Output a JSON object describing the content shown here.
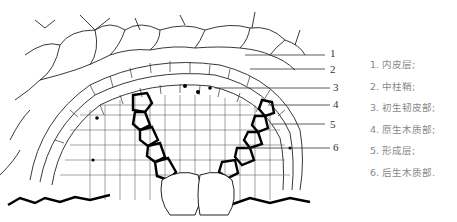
{
  "figure": {
    "type": "root cross-section diagram",
    "callouts": [
      {
        "number": "1",
        "y": 47
      },
      {
        "number": "2",
        "y": 67
      },
      {
        "number": "3",
        "y": 87
      },
      {
        "number": "4",
        "y": 104
      },
      {
        "number": "5",
        "y": 125
      },
      {
        "number": "6",
        "y": 146
      }
    ]
  },
  "legend": {
    "items": [
      {
        "label": "1. 内皮层;"
      },
      {
        "label": "2. 中柱鞘;"
      },
      {
        "label": "3. 初生韧皮部;"
      },
      {
        "label": "4. 原生木质部;"
      },
      {
        "label": "5. 形成层;"
      },
      {
        "label": "6. 后生木质部."
      }
    ]
  }
}
